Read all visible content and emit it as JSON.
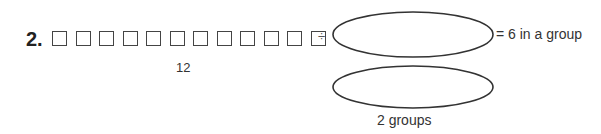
{
  "problem": {
    "number": "2.",
    "square_count": 12,
    "total_label": "12",
    "operator": "÷",
    "result_text": "= 6 in a group",
    "groups_label": "2 groups"
  }
}
